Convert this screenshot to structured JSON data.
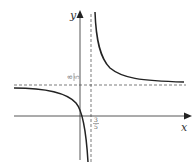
{
  "diagram": {
    "type": "function-graph",
    "axes": {
      "x_label": "x",
      "y_label": "y"
    },
    "asymptotes": {
      "vertical": {
        "label_num": "3",
        "label_den": "5",
        "value": "3/5"
      },
      "horizontal": {
        "label_num": "8",
        "label_den": "5",
        "value": "8/5"
      }
    },
    "colors": {
      "curve": "#222222",
      "axis": "#444444",
      "dashed": "#444444"
    }
  }
}
